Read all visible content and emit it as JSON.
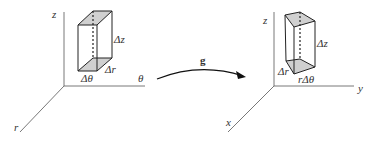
{
  "diagram": {
    "left": {
      "axes": {
        "vertical": "z",
        "horizontal": "θ",
        "diagonal": "r"
      },
      "box_labels": {
        "height": "Δz",
        "depth": "Δr",
        "width": "Δθ"
      }
    },
    "arrow": {
      "label": "g"
    },
    "right": {
      "axes": {
        "vertical": "z",
        "horizontal": "y",
        "diagonal": "x"
      },
      "box_labels": {
        "height": "Δz",
        "depth": "Δr",
        "width": "rΔθ"
      }
    },
    "colors": {
      "line": "#333333",
      "face_fill": "#d0d0d0",
      "background": "#ffffff"
    }
  }
}
